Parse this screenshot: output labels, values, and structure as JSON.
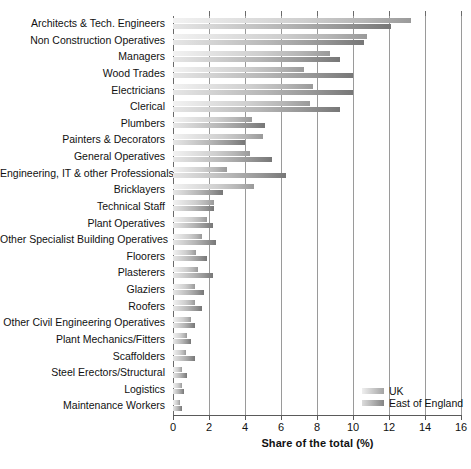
{
  "chart_data": {
    "type": "bar",
    "orientation": "horizontal",
    "title": "",
    "xlabel": "Share of the total (%)",
    "ylabel": "",
    "xlim": [
      0,
      16
    ],
    "xticks": [
      0,
      2,
      4,
      6,
      8,
      10,
      12,
      14,
      16
    ],
    "grid": "vertical",
    "legend_position": "bottom-right",
    "categories": [
      "Architects & Tech. Engineers",
      "Non Construction Operatives",
      "Managers",
      "Wood Trades",
      "Electricians",
      "Clerical",
      "Plumbers",
      "Painters & Decorators",
      "General Operatives",
      "Engineering, IT & other Professionals",
      "Bricklayers",
      "Technical Staff",
      "Plant Operatives",
      "Other Specialist Building Operatives",
      "Floorers",
      "Plasterers",
      "Glaziers",
      "Roofers",
      "Other Civil Engineering Operatives",
      "Plant Mechanics/Fitters",
      "Scaffolders",
      "Steel Erectors/Structural",
      "Logistics",
      "Maintenance Workers"
    ],
    "series": [
      {
        "name": "UK",
        "color": "#c9c9c9",
        "values": [
          13.2,
          10.8,
          8.7,
          7.3,
          7.8,
          7.6,
          4.4,
          5.0,
          4.3,
          3.0,
          4.5,
          2.3,
          1.9,
          1.6,
          1.3,
          1.4,
          1.2,
          1.2,
          1.0,
          0.8,
          0.7,
          0.5,
          0.5,
          0.4
        ]
      },
      {
        "name": "East of England",
        "color": "#8f8f8f",
        "values": [
          12.1,
          10.6,
          9.3,
          10.0,
          10.0,
          9.3,
          5.1,
          4.0,
          5.5,
          6.3,
          2.8,
          2.3,
          2.2,
          2.4,
          1.9,
          2.2,
          1.7,
          1.6,
          1.2,
          1.0,
          1.2,
          0.8,
          0.6,
          0.5
        ]
      }
    ]
  }
}
